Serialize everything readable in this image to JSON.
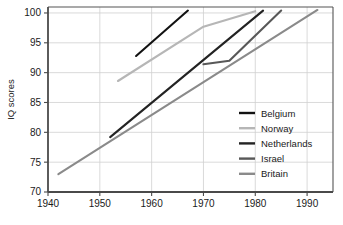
{
  "chart_data": {
    "type": "line",
    "title": "",
    "xlabel": "",
    "ylabel": "IQ scores",
    "xlim": [
      1940,
      1995
    ],
    "ylim": [
      70,
      101
    ],
    "grid": true,
    "legend_position": "inside-right-middle",
    "xticks": [
      1940,
      1950,
      1960,
      1970,
      1980,
      1990
    ],
    "xtick_labels": [
      "1940",
      "1950",
      "1960",
      "1970",
      "1980",
      "1990"
    ],
    "yticks": [
      70,
      75,
      80,
      85,
      90,
      95,
      100
    ],
    "ytick_labels": [
      "70",
      "75",
      "80",
      "85",
      "90",
      "95",
      "100"
    ],
    "series": [
      {
        "name": "Belgium",
        "color": "#121212",
        "width": 2.1,
        "x": [
          1957,
          1967
        ],
        "y": [
          92.8,
          100.4
        ]
      },
      {
        "name": "Norway",
        "color": "#b6b6b6",
        "width": 2.1,
        "x": [
          1953.5,
          1970,
          1980
        ],
        "y": [
          88.6,
          97.7,
          100.3
        ]
      },
      {
        "name": "Netherlands",
        "color": "#232323",
        "width": 2.1,
        "x": [
          1952,
          1981.5
        ],
        "y": [
          79.2,
          100.4
        ]
      },
      {
        "name": "Israel",
        "color": "#585858",
        "width": 2.1,
        "x": [
          1970,
          1975,
          1985
        ],
        "y": [
          91.4,
          92.0,
          100.4
        ]
      },
      {
        "name": "Britain",
        "color": "#8a8a8a",
        "width": 2.1,
        "x": [
          1942,
          1992
        ],
        "y": [
          73.0,
          100.5
        ]
      }
    ],
    "legend_entries": [
      {
        "label": "Belgium",
        "color": "#121212"
      },
      {
        "label": "Norway",
        "color": "#b6b6b6"
      },
      {
        "label": "Netherlands",
        "color": "#232323"
      },
      {
        "label": "Israel",
        "color": "#585858"
      },
      {
        "label": "Britain",
        "color": "#8a8a8a"
      }
    ]
  },
  "style": {
    "frame_color": "#555555",
    "grid_color": "#d0d0d0",
    "background": "#ffffff",
    "text_color": "#1a1a1a"
  }
}
